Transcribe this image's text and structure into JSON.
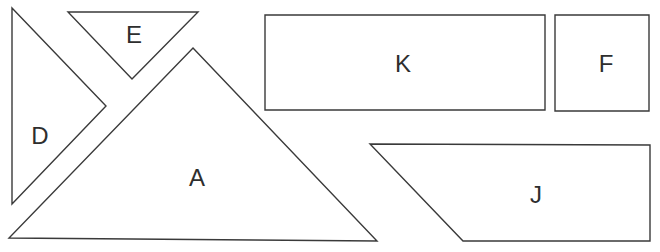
{
  "diagram": {
    "type": "tangram-pieces",
    "stroke_color": "#3a3a3a",
    "pieces": [
      {
        "id": "D",
        "label": "D",
        "shape": "right-triangle",
        "points": "12,8 106,106 12,204",
        "label_pos": [
          40,
          138
        ]
      },
      {
        "id": "E",
        "label": "E",
        "shape": "triangle",
        "points": "68,12 198,12 132,79",
        "label_pos": [
          134,
          36
        ]
      },
      {
        "id": "A",
        "label": "A",
        "shape": "right-triangle",
        "points": "193,48 377,241 9,238",
        "label_pos": [
          197,
          180
        ]
      },
      {
        "id": "K",
        "label": "K",
        "shape": "rectangle",
        "points": "265,15 545,15 545,110 265,110",
        "label_pos": [
          403,
          65
        ]
      },
      {
        "id": "F",
        "label": "F",
        "shape": "square",
        "points": "555,15 649,15 649,111 555,111",
        "label_pos": [
          606,
          65
        ]
      },
      {
        "id": "J",
        "label": "J",
        "shape": "trapezoid",
        "points": "370,144 650,145 650,241 463,241",
        "label_pos": [
          536,
          197
        ]
      }
    ]
  }
}
